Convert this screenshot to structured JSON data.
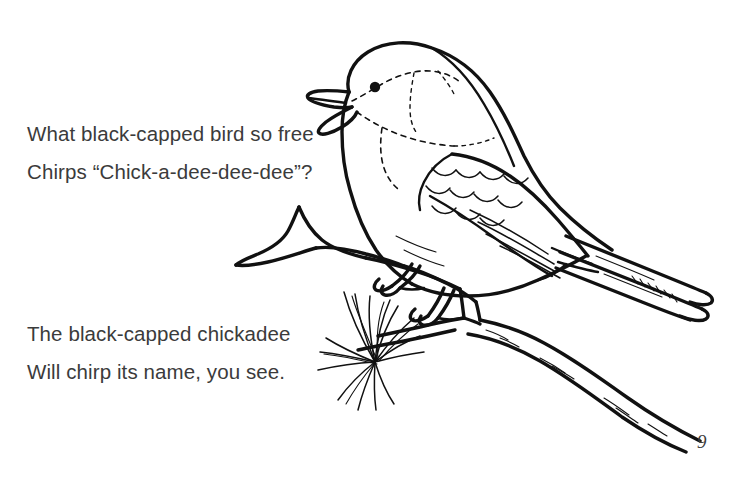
{
  "page": {
    "title": "What black-capped bird so free",
    "background_color": "#ffffff",
    "ink_color": "#111111",
    "text_color": "#3b3b3b",
    "page_number": "9",
    "width": 747,
    "height": 488
  },
  "verses": [
    {
      "id": "verse-one",
      "lines": [
        "What black-capped bird so free",
        "Chirps “Chick-a-dee-dee-dee”?"
      ]
    },
    {
      "id": "verse-two",
      "lines": [
        "The black-capped chickadee",
        "Will chirp its name, you see."
      ]
    }
  ],
  "illustration": {
    "subject": "black-capped chickadee perched on a pine branch",
    "style": "line-art coloring page",
    "parts": [
      "bird-head",
      "bird-beak",
      "bird-eye",
      "bird-cap-marking",
      "bird-bib-marking",
      "bird-body",
      "bird-wing",
      "bird-tail",
      "bird-leg-front",
      "bird-leg-rear",
      "branch-upper",
      "branch-lower",
      "pine-needle-cluster"
    ]
  }
}
